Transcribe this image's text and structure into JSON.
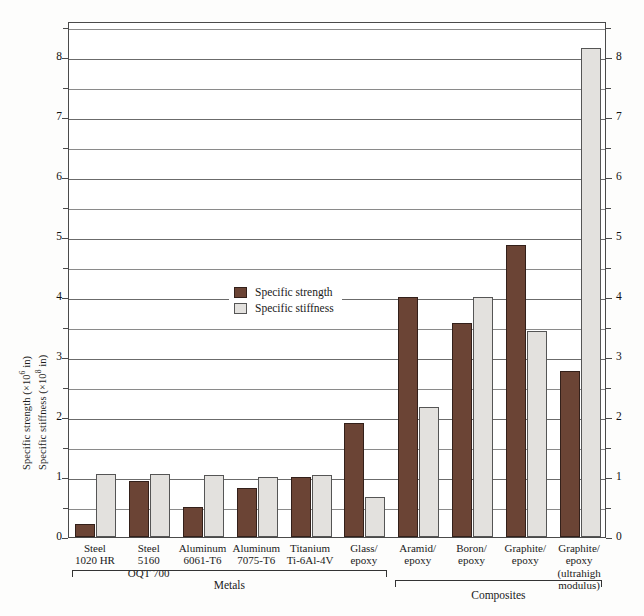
{
  "chart_data": {
    "type": "bar",
    "title": "",
    "xlabel": "",
    "ylabel_1": "Specific strength (×10⁶ in)",
    "ylabel_2": "Specific stiffness (×10⁸ in)",
    "ylim": [
      0,
      8.6
    ],
    "yticks": [
      0,
      1,
      2,
      3,
      4,
      5,
      6,
      7,
      8
    ],
    "minor_gridlines": [
      0.5,
      1.5,
      2.5,
      3.5,
      4.5,
      5.5,
      6.5,
      7.5,
      8.5
    ],
    "grid": true,
    "legend_position": "inside-left",
    "categories": [
      "Steel 1020 HR",
      "Steel 5160 OQT 700",
      "Aluminum 6061-T6",
      "Aluminum 7075-T6",
      "Titanium Ti-6Al-4V",
      "Glass/ epoxy",
      "Aramid/ epoxy",
      "Boron/ epoxy",
      "Graphite/ epoxy",
      "Graphite/ epoxy (ultrahigh modulus)"
    ],
    "series": [
      {
        "name": "Specific strength",
        "color": "#6b4435",
        "values": [
          0.21,
          0.93,
          0.5,
          0.82,
          1.0,
          1.9,
          4.0,
          3.57,
          4.87,
          2.77
        ]
      },
      {
        "name": "Specific stiffness",
        "color": "#e3e1de",
        "values": [
          1.05,
          1.05,
          1.03,
          1.0,
          1.03,
          0.67,
          2.16,
          4.0,
          3.43,
          8.15
        ]
      }
    ],
    "groups": [
      {
        "label": "Metals",
        "from": 0,
        "to": 5
      },
      {
        "label": "Composites",
        "from": 6,
        "to": 9
      }
    ]
  },
  "axis": {
    "left_title_strength": "Specific strength (×10",
    "left_title_strength_exp": "6",
    "left_title_strength_tail": " in)",
    "left_title_stiffness": "Specific stiffness (×10",
    "left_title_stiffness_exp": "8",
    "left_title_stiffness_tail": " in)"
  },
  "legend": {
    "items": [
      {
        "label": "Specific strength",
        "swatch": "strength"
      },
      {
        "label": "Specific stiffness",
        "swatch": "stiffness"
      }
    ]
  },
  "categories_display": [
    [
      "Steel",
      "1020 HR"
    ],
    [
      "Steel",
      "5160",
      "OQT 700"
    ],
    [
      "Aluminum",
      "6061-T6"
    ],
    [
      "Aluminum",
      "7075-T6"
    ],
    [
      "Titanium",
      "Ti-6Al-4V"
    ],
    [
      "Glass/",
      "epoxy"
    ],
    [
      "Aramid/",
      "epoxy"
    ],
    [
      "Boron/",
      "epoxy"
    ],
    [
      "Graphite/",
      "epoxy"
    ],
    [
      "Graphite/",
      "epoxy",
      "(ultrahigh",
      "modulus)"
    ]
  ]
}
